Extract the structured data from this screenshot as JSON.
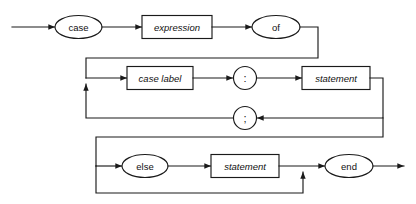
{
  "diagram": {
    "type": "railroad-syntax-diagram",
    "name": "case-statement",
    "background_color": "#ffffff",
    "line_color": "#1a1a1a",
    "text_color": "#111111",
    "nodes": [
      {
        "id": "case",
        "label": "case",
        "shape": "ellipse",
        "style": "upright",
        "row": 1
      },
      {
        "id": "expression",
        "label": "expression",
        "shape": "box",
        "style": "italic",
        "row": 1
      },
      {
        "id": "of",
        "label": "of",
        "shape": "ellipse",
        "style": "upright",
        "row": 1
      },
      {
        "id": "case-label",
        "label": "case label",
        "shape": "box",
        "style": "italic",
        "row": 2
      },
      {
        "id": "colon",
        "label": ":",
        "shape": "circle",
        "style": "upright",
        "row": 2
      },
      {
        "id": "statement-1",
        "label": "statement",
        "shape": "box",
        "style": "italic",
        "row": 2
      },
      {
        "id": "semicolon",
        "label": ";",
        "shape": "circle",
        "style": "upright",
        "row": 3
      },
      {
        "id": "else",
        "label": "else",
        "shape": "ellipse",
        "style": "upright",
        "row": 4
      },
      {
        "id": "statement-2",
        "label": "statement",
        "shape": "box",
        "style": "italic",
        "row": 4
      },
      {
        "id": "end",
        "label": "end",
        "shape": "ellipse",
        "style": "upright",
        "row": 4
      }
    ],
    "labels": {
      "case": "case",
      "expression": "expression",
      "of": "of",
      "case_label": "case label",
      "colon": ":",
      "statement_1": "statement",
      "semicolon": ";",
      "else": "else",
      "statement_2": "statement",
      "end": "end"
    }
  }
}
